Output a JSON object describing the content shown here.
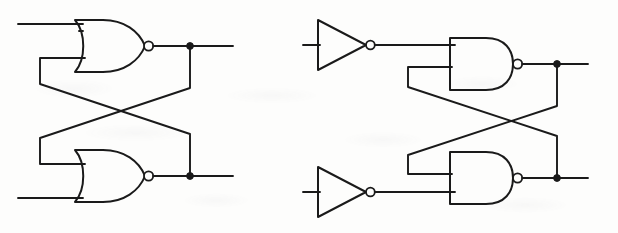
{
  "figure": {
    "background_color": "#fdfdfc",
    "line_color": "#1a1a1a",
    "width": 618,
    "height": 233,
    "circuit_count": 2
  },
  "circuits": [
    {
      "id": "nor-latch",
      "name": "NOR cross-coupled latch",
      "gate_type": "NOR",
      "gate_count": 2,
      "inverter_count": 0,
      "description": "Two NOR gates with outputs cross-coupled to the opposite gate inputs",
      "gates": [
        {
          "name": "top-nor-gate",
          "type": "NOR",
          "body_left": 75,
          "body_right": 140,
          "top": 20,
          "bottom": 72,
          "center_y": 46,
          "bubble_cx": 144,
          "bubble_cy": 46,
          "bubble_r": 4.6,
          "input_y_top": 31,
          "input_y_bottom": 61
        },
        {
          "name": "bottom-nor-gate",
          "type": "NOR",
          "body_left": 75,
          "body_right": 140,
          "top": 150,
          "bottom": 202,
          "center_y": 176,
          "bubble_cx": 144,
          "bubble_cy": 176,
          "bubble_r": 4.6,
          "input_y_top": 161,
          "input_y_bottom": 191
        }
      ],
      "junctions": [
        {
          "name": "top-output-junction",
          "cx": 190,
          "cy": 46,
          "r": 3.4
        },
        {
          "name": "bottom-output-junction",
          "cx": 190,
          "cy": 176,
          "r": 3.4
        }
      ],
      "inputs": [
        {
          "name": "top-input-wire",
          "x_start": 18,
          "x_end": 83,
          "y": 24
        },
        {
          "name": "bottom-input-wire",
          "x_start": 18,
          "x_end": 83,
          "y": 198
        }
      ],
      "outputs": [
        {
          "name": "top-output-wire",
          "x_start": 149,
          "x_end": 233,
          "y": 46
        },
        {
          "name": "bottom-output-wire",
          "x_start": 149,
          "x_end": 233,
          "y": 176
        }
      ],
      "cross_wires": [
        {
          "name": "top-output-to-bottom-input",
          "path": "M 190 46 L 190 88 L 40 138 L 40 164 L 83 164"
        },
        {
          "name": "bottom-output-to-top-input",
          "path": "M 190 176 L 190 134 L 40 84 L 40 58 L 83 58"
        }
      ]
    },
    {
      "id": "nand-latch",
      "name": "NAND cross-coupled latch with input inverters",
      "gate_type": "NAND",
      "gate_count": 2,
      "inverter_count": 2,
      "description": "Two NAND gates cross-coupled, each driven by an inverter on its external input",
      "inverters": [
        {
          "name": "top-inverter",
          "type": "NOT",
          "apex_x": 366,
          "tip_y": 45,
          "back_x": 318,
          "top": 20,
          "bottom": 70,
          "bubble_cx": 370,
          "bubble_cy": 45,
          "bubble_r": 4.4
        },
        {
          "name": "bottom-inverter",
          "type": "NOT",
          "apex_x": 366,
          "tip_y": 192,
          "back_x": 318,
          "top": 167,
          "bottom": 217,
          "bubble_cx": 370,
          "bubble_cy": 192,
          "bubble_r": 4.4
        }
      ],
      "gates": [
        {
          "name": "top-nand-gate",
          "type": "NAND",
          "body_left": 450,
          "body_right": 512,
          "top": 38,
          "bottom": 90,
          "center_y": 64,
          "bubble_cx": 516,
          "bubble_cy": 64,
          "bubble_r": 4.6,
          "input_y_top": 45,
          "input_y_bottom": 81
        },
        {
          "name": "bottom-nand-gate",
          "type": "NAND",
          "body_left": 450,
          "body_right": 512,
          "top": 152,
          "bottom": 204,
          "center_y": 178,
          "bubble_cx": 516,
          "bubble_cy": 178,
          "bubble_r": 4.6,
          "input_y_top": 161,
          "input_y_bottom": 192
        }
      ],
      "junctions": [
        {
          "name": "top-output-junction",
          "cx": 557,
          "cy": 64,
          "r": 3.4
        },
        {
          "name": "bottom-output-junction",
          "cx": 557,
          "cy": 178,
          "r": 3.4
        }
      ],
      "inputs": [
        {
          "name": "top-input-wire",
          "x_start": 303,
          "x_end": 318,
          "y": 45
        },
        {
          "name": "bottom-input-wire",
          "x_start": 303,
          "x_end": 318,
          "y": 192
        }
      ],
      "outputs": [
        {
          "name": "top-output-wire",
          "x_start": 521,
          "x_end": 588,
          "y": 64
        },
        {
          "name": "bottom-output-wire",
          "x_start": 521,
          "x_end": 588,
          "y": 178
        }
      ],
      "connections": [
        {
          "name": "top-inverter-to-nand",
          "x_start": 375,
          "x_end": 455,
          "y": 45
        },
        {
          "name": "bottom-inverter-to-nand",
          "x_start": 375,
          "x_end": 455,
          "y": 192
        }
      ],
      "cross_wires": [
        {
          "name": "top-output-to-bottom-input",
          "path": "M 557 64 L 557 106 L 408 155 L 408 174 L 455 174"
        },
        {
          "name": "bottom-output-to-top-input",
          "path": "M 557 178 L 557 136 L 408 87 L 408 67 L 455 67"
        }
      ]
    }
  ],
  "legend": {
    "nor_gate_label": "NOR",
    "nand_gate_label": "NAND",
    "inverter_label": "NOT",
    "bubble_label": "inversion-bubble",
    "junction_label": "wire-junction-dot"
  }
}
